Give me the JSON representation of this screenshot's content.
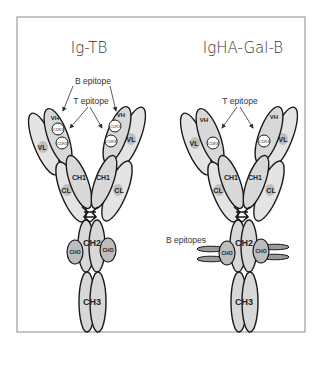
{
  "figure": {
    "panels": [
      {
        "title": "Ig-TB",
        "annotations": {
          "b_epitope": "B epitope",
          "t_epitope": "T epitope"
        },
        "domains": {
          "vh": "VH",
          "vl": "VL",
          "ch1": "CH1",
          "cl": "CL",
          "ch2": "CH2",
          "ch3": "CH3",
          "cdr2": "CDR2",
          "cdr3": "CDR3",
          "cho": "CHO"
        }
      },
      {
        "title": "IgHA-Gal-B",
        "annotations": {
          "t_epitope": "T epitope",
          "b_epitopes": "B epitopes"
        },
        "domains": {
          "vh": "VH",
          "vl": "VL",
          "ch1": "CH1",
          "cl": "CL",
          "ch2": "CH2",
          "ch3": "CH3",
          "cdr3": "CDR3",
          "cho": "CHO"
        }
      }
    ]
  }
}
